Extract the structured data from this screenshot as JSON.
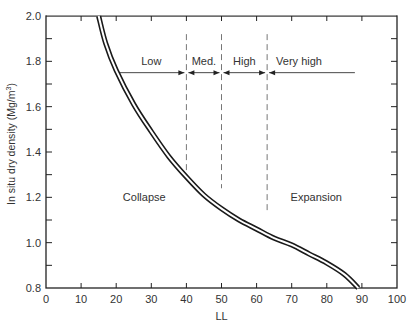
{
  "chart_data": {
    "type": "line",
    "title": "",
    "xlabel": "LL",
    "ylabel": "In situ dry density (Mg/m³)",
    "ylabel_parts": {
      "main": "In situ dry density (Mg/m",
      "sup": "3",
      "end": ")"
    },
    "xlim": [
      0,
      100
    ],
    "ylim": [
      0.8,
      2.0
    ],
    "xticks": [
      0,
      10,
      20,
      30,
      40,
      50,
      60,
      70,
      80,
      90,
      100
    ],
    "yticks": [
      0.8,
      1.0,
      1.2,
      1.4,
      1.6,
      1.8,
      2.0
    ],
    "ytick_labels": [
      "0.8",
      "1.0",
      "1.2",
      "1.4",
      "1.6",
      "1.8",
      "2.0"
    ],
    "grid": false,
    "legend": null,
    "series": [
      {
        "name": "Collapse/expansion boundary",
        "style": "double-line",
        "x": [
          15,
          17,
          20,
          25,
          30,
          35,
          40,
          45,
          50,
          55,
          60,
          65,
          70,
          75,
          80,
          85,
          89
        ],
        "y": [
          2.0,
          1.88,
          1.76,
          1.61,
          1.49,
          1.38,
          1.29,
          1.21,
          1.15,
          1.1,
          1.06,
          1.02,
          0.99,
          0.95,
          0.91,
          0.86,
          0.8
        ]
      }
    ],
    "dividers": [
      {
        "x": 40,
        "y_from": 1.3,
        "y_to": 1.92,
        "style": "dashed"
      },
      {
        "x": 50,
        "y_from": 1.24,
        "y_to": 1.92,
        "style": "dashed"
      },
      {
        "x": 63,
        "y_from": 1.13,
        "y_to": 1.92,
        "style": "dashed"
      }
    ],
    "ranges": [
      {
        "label": "Low",
        "from": 20,
        "to": 40
      },
      {
        "label": "Med.",
        "from": 40,
        "to": 50
      },
      {
        "label": "High",
        "from": 50,
        "to": 63
      },
      {
        "label": "Very high",
        "from": 63,
        "to": 88
      }
    ],
    "range_arrow_y": 1.75,
    "annotations": [
      {
        "text": "Collapse",
        "x": 28,
        "y": 1.2
      },
      {
        "text": "Expansion",
        "x": 77,
        "y": 1.2
      }
    ]
  }
}
